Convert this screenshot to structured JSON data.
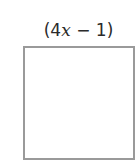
{
  "diagram": {
    "shape": "square",
    "side_label": {
      "open": "(",
      "coefficient": "4",
      "variable": "x",
      "operator": " − ",
      "constant": "1",
      "close": ")"
    },
    "colors": {
      "stroke": "#9a9a9a",
      "fill": "#ffffff",
      "text": "#2a2a2a"
    }
  }
}
